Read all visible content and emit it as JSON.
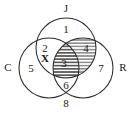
{
  "figure": {
    "background_color": "#ffffff",
    "stroke_color": "#2b2b2b",
    "text_color": "#1a1a1a"
  },
  "sets": [
    {
      "id": "J",
      "label": "J",
      "position": "top",
      "label_x": 66,
      "label_y": 9,
      "cx": 66,
      "cy": 48,
      "r": 30
    },
    {
      "id": "C",
      "label": "C",
      "position": "left",
      "label_x": 8,
      "label_y": 68,
      "cx": 49,
      "cy": 68,
      "r": 30
    },
    {
      "id": "R",
      "label": "R",
      "position": "right",
      "label_x": 123,
      "label_y": 68,
      "cx": 83,
      "cy": 68,
      "r": 30
    }
  ],
  "regions": [
    {
      "id": "r1",
      "label": "1",
      "meaning": "J only",
      "x": 66,
      "y": 30,
      "shaded": false
    },
    {
      "id": "r2",
      "label": "2",
      "meaning": "C and J only",
      "x": 45,
      "y": 49,
      "shaded": false
    },
    {
      "id": "r3",
      "label": "3",
      "meaning": "C and J and R",
      "x": 64,
      "y": 64,
      "shaded": true
    },
    {
      "id": "r4",
      "label": "4",
      "meaning": "J and R only",
      "x": 86,
      "y": 49,
      "shaded": true
    },
    {
      "id": "r5",
      "label": "5",
      "meaning": "C only",
      "x": 31,
      "y": 69,
      "shaded": false
    },
    {
      "id": "r6",
      "label": "6",
      "meaning": "C and R only",
      "x": 66,
      "y": 86,
      "shaded": false
    },
    {
      "id": "r7",
      "label": "7",
      "meaning": "R only",
      "x": 101,
      "y": 69,
      "shaded": false
    },
    {
      "id": "r8",
      "label": "8",
      "meaning": "outside all sets",
      "x": 66,
      "y": 104,
      "shaded": false
    }
  ],
  "markers": [
    {
      "id": "x-marker",
      "label": "X",
      "meaning": "point in C and J region",
      "x": 45,
      "y": 59
    }
  ],
  "hatching": {
    "style": "horizontal-lines",
    "color": "#2b2b2b",
    "spacing_px": 3.2,
    "covers_regions": [
      "3",
      "4"
    ]
  }
}
